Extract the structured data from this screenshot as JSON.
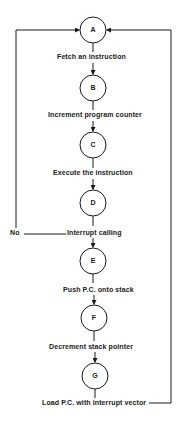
{
  "diagram": {
    "nodes": [
      {
        "id": "A",
        "label": "A"
      },
      {
        "id": "B",
        "label": "B"
      },
      {
        "id": "C",
        "label": "C"
      },
      {
        "id": "D",
        "label": "D"
      },
      {
        "id": "E",
        "label": "E"
      },
      {
        "id": "F",
        "label": "F"
      },
      {
        "id": "G",
        "label": "G"
      }
    ],
    "steps": [
      "Fetch an instruction",
      "Increment program counter",
      "Execute the instruction",
      "Interrupt calling",
      "Push P.C. onto stack",
      "Decrement stack pointer",
      "Load P.C. with interrupt vector"
    ],
    "branch_label": "No",
    "colors": {
      "line": "#1a1a1a",
      "background": "#ffffff"
    }
  }
}
